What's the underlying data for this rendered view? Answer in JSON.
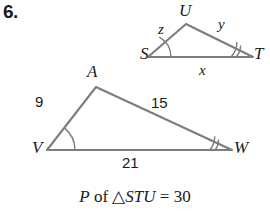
{
  "problem": {
    "number": "6."
  },
  "colors": {
    "stroke": "#7d7d7d",
    "arc": "#7d7d7d",
    "text": "#1a1a1a",
    "background": "#ffffff"
  },
  "small_triangle": {
    "name": "STU",
    "vertices": [
      {
        "label": "S",
        "x": 148,
        "y": 57,
        "label_x": 140,
        "label_y": 45
      },
      {
        "label": "T",
        "x": 253,
        "y": 57,
        "label_x": 254,
        "label_y": 45
      },
      {
        "label": "U",
        "x": 186,
        "y": 24,
        "label_x": 179,
        "label_y": 2
      }
    ],
    "side_labels": [
      {
        "label": "x",
        "x": 199,
        "y": 63
      },
      {
        "label": "y",
        "x": 218,
        "y": 17
      },
      {
        "label": "z",
        "x": 158,
        "y": 22
      }
    ],
    "angle_marks": [
      {
        "vertex": "S",
        "arcs": 1
      },
      {
        "vertex": "T",
        "arcs": 2
      }
    ]
  },
  "large_triangle": {
    "name": "AVW",
    "vertices": [
      {
        "label": "A",
        "x": 96,
        "y": 87,
        "label_x": 87,
        "label_y": 63
      },
      {
        "label": "V",
        "x": 47,
        "y": 150,
        "label_x": 32,
        "label_y": 139
      },
      {
        "label": "W",
        "x": 232,
        "y": 150,
        "label_x": 234,
        "label_y": 139
      }
    ],
    "side_labels": [
      {
        "label": "9",
        "x": 35,
        "y": 94
      },
      {
        "label": "15",
        "x": 151,
        "y": 95
      },
      {
        "label": "21",
        "x": 122,
        "y": 155
      }
    ],
    "angle_marks": [
      {
        "vertex": "V",
        "arcs": 1
      },
      {
        "vertex": "W",
        "arcs": 2
      }
    ]
  },
  "caption": {
    "perimeter_letter": "P",
    "of_word": " of ",
    "triangle_symbol": "△",
    "triangle_name": "STU",
    "equals": " = ",
    "value": "30"
  }
}
